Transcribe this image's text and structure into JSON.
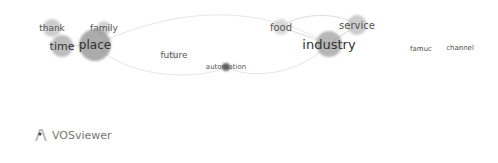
{
  "network": {
    "nodes": [
      {
        "id": "thank",
        "label": "thank",
        "x": 52,
        "y": 28,
        "size": 9,
        "font": 9,
        "color": "#bdbdbd"
      },
      {
        "id": "family",
        "label": "family",
        "x": 104,
        "y": 28,
        "size": 7,
        "font": 9,
        "color": "#c4c4c4"
      },
      {
        "id": "time",
        "label": "time",
        "x": 62,
        "y": 46,
        "size": 11,
        "font": 11,
        "color": "#a8a8a8"
      },
      {
        "id": "place",
        "label": "place",
        "x": 95,
        "y": 45,
        "size": 16,
        "font": 12,
        "color": "#8f8f8f"
      },
      {
        "id": "future",
        "label": "future",
        "x": 174,
        "y": 55,
        "size": 4,
        "font": 9,
        "color": "#dcdcdc"
      },
      {
        "id": "automation",
        "label": "automation",
        "x": 226,
        "y": 67,
        "size": 4,
        "font": 7,
        "color": "#333333"
      },
      {
        "id": "food",
        "label": "food",
        "x": 281,
        "y": 27,
        "size": 8,
        "font": 10,
        "color": "#cfcfcf"
      },
      {
        "id": "service",
        "label": "service",
        "x": 357,
        "y": 25,
        "size": 10,
        "font": 10,
        "color": "#bbbbbb"
      },
      {
        "id": "industry",
        "label": "industry",
        "x": 329,
        "y": 44,
        "size": 13,
        "font": 13,
        "color": "#9f9f9f"
      },
      {
        "id": "famuc",
        "label": "famuc",
        "x": 421,
        "y": 49,
        "size": 2,
        "font": 7,
        "color": "#e0e0e0"
      },
      {
        "id": "channel",
        "label": "channel",
        "x": 460,
        "y": 48,
        "size": 2,
        "font": 7,
        "color": "#e0e0e0"
      }
    ]
  },
  "branding": {
    "logo_text": "VOSviewer"
  }
}
